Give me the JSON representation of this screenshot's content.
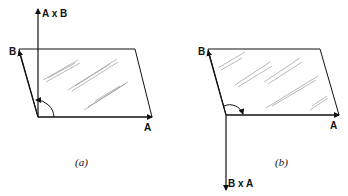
{
  "figures": [
    {
      "id": "a",
      "caption": "(a)",
      "labels": {
        "a": "A",
        "b": "B",
        "cross": "A x B"
      },
      "cross_direction": "up"
    },
    {
      "id": "b",
      "caption": "(b)",
      "labels": {
        "a": "A",
        "b": "B",
        "cross": "B x A"
      },
      "cross_direction": "down"
    }
  ],
  "colors": {
    "ink": "#111111",
    "background": "#ffffff"
  }
}
